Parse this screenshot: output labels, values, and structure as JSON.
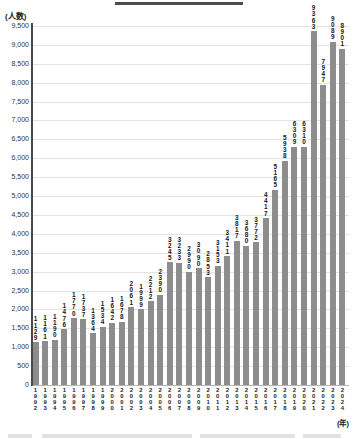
{
  "chart_data": {
    "type": "bar",
    "title": "",
    "ylabel_unit": "(人数)",
    "xlabel_unit": "(年)",
    "categories": [
      "1992",
      "1993",
      "1994",
      "1995",
      "1996",
      "1997",
      "1998",
      "1999",
      "2000",
      "2001",
      "2002",
      "2003",
      "2004",
      "2005",
      "2006",
      "2007",
      "2008",
      "2009",
      "2010",
      "2011",
      "2012",
      "2013",
      "2014",
      "2015",
      "2016",
      "2017",
      "2018",
      "2019",
      "2020",
      "2021",
      "2022",
      "2023",
      "2024"
    ],
    "values": [
      1129,
      1161,
      1190,
      1476,
      1770,
      1737,
      1364,
      1534,
      1642,
      1678,
      2061,
      1999,
      2212,
      2390,
      3245,
      3233,
      2990,
      3090,
      2853,
      3153,
      3411,
      3817,
      3680,
      3772,
      4417,
      5165,
      5938,
      6309,
      6310,
      9363,
      7947,
      9089,
      8901
    ],
    "ylim": [
      0,
      9500
    ],
    "ytick_step": 500,
    "grid": true,
    "legend": "none",
    "bar_color": "#8d8d8d",
    "value_label_color": "#161616",
    "axis_color": "#4a4a4a",
    "gridline_color": "#e3e3e3"
  }
}
